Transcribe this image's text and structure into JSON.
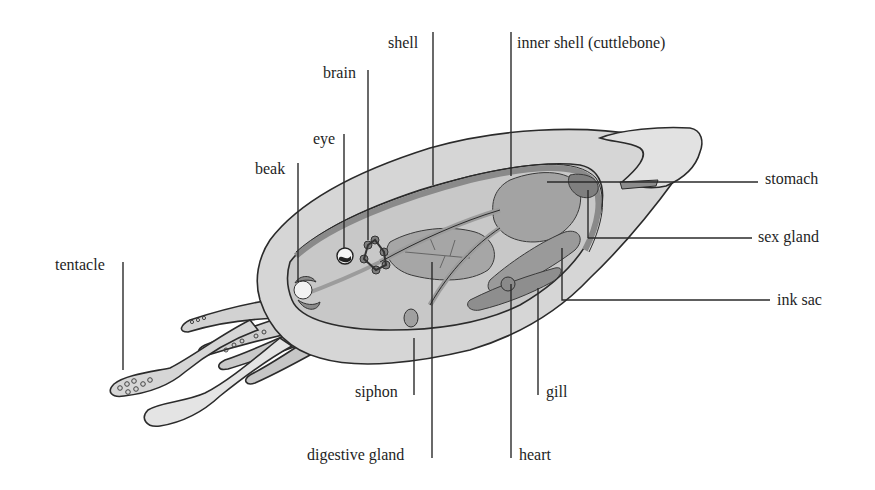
{
  "diagram": {
    "colors": {
      "background": "#ffffff",
      "body_light": "#dcdcdc",
      "body_mid": "#c4c4c4",
      "organ": "#9e9e9e",
      "organ_dark": "#7d7d7d",
      "outline": "#2b2b2b",
      "text": "#1e1e1e"
    },
    "labels": [
      {
        "id": "shell",
        "text": "shell",
        "x": 388,
        "y": 34
      },
      {
        "id": "inner-shell",
        "text": "inner shell (cuttlebone)",
        "x": 517,
        "y": 34
      },
      {
        "id": "brain",
        "text": "brain",
        "x": 323,
        "y": 64
      },
      {
        "id": "eye",
        "text": "eye",
        "x": 313,
        "y": 130
      },
      {
        "id": "beak",
        "text": "beak",
        "x": 255,
        "y": 160
      },
      {
        "id": "stomach",
        "text": "stomach",
        "x": 765,
        "y": 170
      },
      {
        "id": "sex-gland",
        "text": "sex gland",
        "x": 758,
        "y": 228
      },
      {
        "id": "tentacle",
        "text": "tentacle",
        "x": 55,
        "y": 256
      },
      {
        "id": "ink-sac",
        "text": "ink sac",
        "x": 777,
        "y": 291
      },
      {
        "id": "siphon",
        "text": "siphon",
        "x": 355,
        "y": 383
      },
      {
        "id": "gill",
        "text": "gill",
        "x": 546,
        "y": 383
      },
      {
        "id": "digestive-gland",
        "text": "digestive gland",
        "x": 307,
        "y": 446
      },
      {
        "id": "heart",
        "text": "heart",
        "x": 519,
        "y": 446
      }
    ]
  }
}
